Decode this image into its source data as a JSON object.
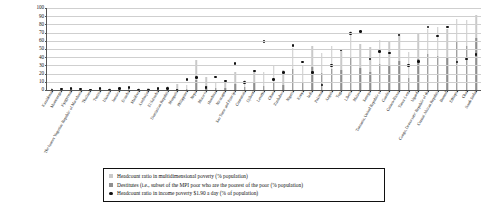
{
  "chart_data": {
    "type": "bar",
    "title": "",
    "subtitle": "",
    "xlabel": "",
    "ylabel": "",
    "ylim": [
      0,
      100
    ],
    "yticks": [
      0,
      10,
      20,
      30,
      40,
      50,
      60,
      70,
      80,
      90,
      100
    ],
    "grid": true,
    "legend_position": "bottom",
    "categories": [
      "Kazakhstan",
      "Montenegro",
      "Kyrgyzstan",
      "The former Yugoslav Republic of Macedonia",
      "Thailand",
      "Tunisia",
      "Ukraine",
      "Jamaica",
      "Ecuador",
      "Maldives",
      "Azerbaijan",
      "El Salvador",
      "Dominican Republic",
      "Mongolia",
      "Philippines",
      "Nepal",
      "Morocco",
      "Honduras",
      "Nicaragua",
      "Sao Tome and Principe",
      "Guatemala",
      "Djibouti",
      "Lesotho",
      "Ghana",
      "Zimbabwe",
      "Nigeria",
      "Kenya",
      "India",
      "Pakistan",
      "Angola",
      "Togo",
      "Liberia",
      "Malawi",
      "Senegal",
      "Tanzania, United Republic of",
      "Gambia",
      "Guinea-Bissau",
      "Timor-Leste",
      "Uganda",
      "Congo, Democratic Republic of the",
      "Central African Republic",
      "Burundi",
      "Ethiopia",
      "Chad",
      "South Sudan"
    ],
    "series": [
      {
        "name": "Headcount ratio in multidimensional poverty (% population)",
        "color": "#c9c9c9",
        "marker": "bar",
        "values": [
          2,
          2,
          3,
          3,
          1,
          2,
          2,
          2,
          3,
          2,
          3,
          3,
          5,
          7,
          6,
          36,
          16,
          10,
          12,
          22,
          12,
          23,
          22,
          31,
          25,
          51,
          30,
          54,
          45,
          54,
          49,
          72,
          56,
          52,
          61,
          60,
          68,
          46,
          70,
          74,
          77,
          75,
          87,
          85,
          91
        ]
      },
      {
        "name": "Destitutes (i.e., subset of the MPI poor who are the poorest of the poor (% population)",
        "color": "#8f8f8f",
        "marker": "bar",
        "values": [
          0,
          0,
          0,
          0,
          0,
          0,
          0,
          0,
          1,
          0,
          1,
          1,
          1,
          1,
          1,
          12,
          5,
          3,
          3,
          7,
          4,
          10,
          5,
          9,
          6,
          26,
          10,
          28,
          21,
          26,
          24,
          39,
          27,
          22,
          32,
          30,
          35,
          15,
          38,
          44,
          41,
          39,
          58,
          54,
          63
        ]
      },
      {
        "name": "Headcount ratio in income poverty $1.90 a day (% of population)",
        "color": "#111111",
        "marker": "dot",
        "values": [
          0,
          1,
          2,
          1,
          0,
          2,
          0,
          2,
          3,
          0,
          0,
          2,
          2,
          0,
          13,
          15,
          3,
          16,
          11,
          32,
          9,
          23,
          59,
          13,
          21,
          54,
          34,
          21,
          6,
          30,
          49,
          69,
          71,
          38,
          47,
          45,
          67,
          30,
          35,
          77,
          66,
          77,
          34,
          38,
          43
        ]
      }
    ]
  },
  "legend": {
    "items": [
      {
        "swatch": "mpi-bar-swatch",
        "label": "Headcount ratio in multidimensional poverty (% population)"
      },
      {
        "swatch": "destitute-bar-swatch",
        "label": "Destitutes (i.e., subset of the MPI poor who are the poorest of the poor (% population)"
      },
      {
        "swatch": "income-poverty-dot-swatch",
        "label": "Headcount ratio in income poverty $1.90 a day (% of population)"
      }
    ]
  }
}
